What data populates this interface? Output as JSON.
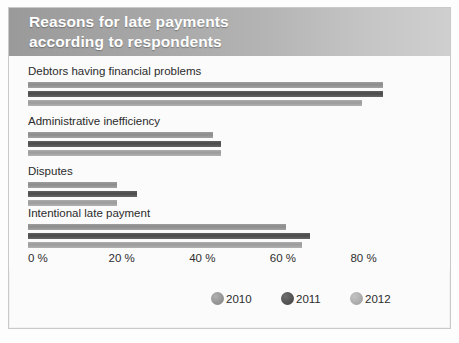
{
  "title": {
    "line1": "Reasons for late payments",
    "line2": "according to respondents"
  },
  "colors": {
    "banner_dark": "#9a9a9a",
    "banner_light": "#cfcfcf",
    "series_2010": "#9a9a9a",
    "series_2011": "#555555",
    "series_2012": "#acacac",
    "background": "#fbfbfb",
    "text": "#2b2b2b"
  },
  "chart_data": {
    "type": "bar",
    "orientation": "horizontal",
    "title": "Reasons for late payments according to respondents",
    "xlabel": "",
    "ylabel": "",
    "xlim": [
      0,
      90
    ],
    "grid": false,
    "legend_position": "bottom-right",
    "tick_labels": [
      "0 %",
      "20 %",
      "40 %",
      "60 %",
      "80 %"
    ],
    "tick_values": [
      0,
      20,
      40,
      60,
      80
    ],
    "categories": [
      "Debtors having financial problems",
      "Administrative inefficiency",
      "Disputes",
      "Intentional late payment"
    ],
    "series": [
      {
        "name": "2010",
        "values": [
          88,
          46,
          22,
          64
        ]
      },
      {
        "name": "2011",
        "values": [
          88,
          48,
          27,
          70
        ]
      },
      {
        "name": "2012",
        "values": [
          83,
          48,
          22,
          68
        ]
      }
    ]
  },
  "legend": [
    {
      "label": "2010"
    },
    {
      "label": "2011"
    },
    {
      "label": "2012"
    }
  ]
}
